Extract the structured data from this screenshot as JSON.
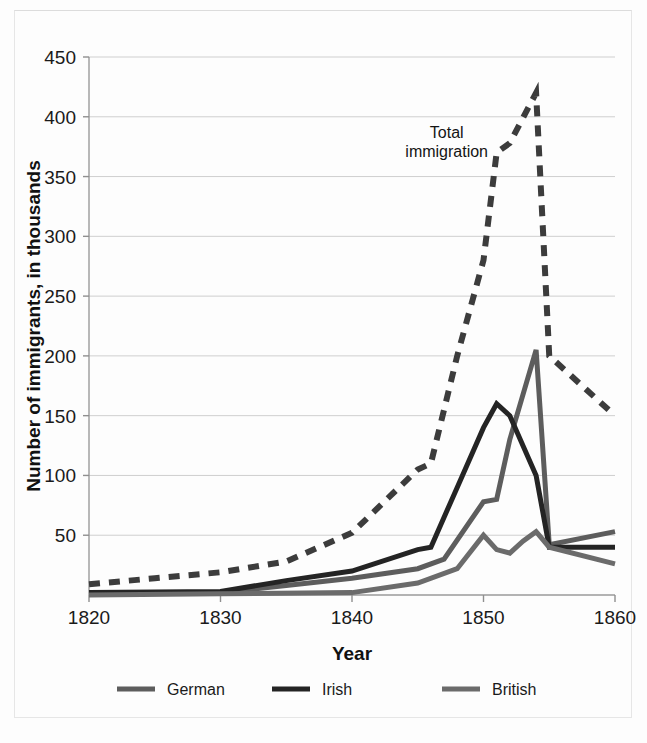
{
  "chart_data": {
    "type": "line",
    "title": "",
    "xlabel": "Year",
    "ylabel": "Number of immigrants, in thousands",
    "xlim": [
      1820,
      1860
    ],
    "ylim": [
      0,
      450
    ],
    "xticks": [
      "1820",
      "1830",
      "1840",
      "1850",
      "1860"
    ],
    "yticks": [
      "0",
      "50",
      "100",
      "150",
      "200",
      "250",
      "300",
      "350",
      "400",
      "450"
    ],
    "ytick_values": [
      50,
      100,
      150,
      200,
      250,
      300,
      350,
      400,
      450
    ],
    "grid": "horizontal",
    "legend_position": "bottom",
    "annotations": [
      {
        "name": "total-immigration-label",
        "lines": [
          "Total",
          "immigration"
        ],
        "x": 1847.2,
        "y": 382
      }
    ],
    "series": [
      {
        "name": "Total immigration",
        "key": "total",
        "style": "dashed",
        "color": "#3c3c3c",
        "width": 6,
        "in_legend": false,
        "x": [
          1820,
          1825,
          1830,
          1835,
          1840,
          1845,
          1846,
          1848,
          1850,
          1851,
          1852,
          1854,
          1855,
          1860
        ],
        "y": [
          9,
          14,
          19,
          28,
          52,
          105,
          110,
          200,
          280,
          370,
          378,
          420,
          200,
          150
        ]
      },
      {
        "name": "German",
        "key": "german",
        "style": "solid",
        "color": "#5d5d5d",
        "width": 5,
        "in_legend": true,
        "x": [
          1820,
          1830,
          1835,
          1840,
          1845,
          1847,
          1850,
          1851,
          1852,
          1854,
          1855,
          1860
        ],
        "y": [
          1,
          2,
          8,
          14,
          22,
          30,
          78,
          80,
          130,
          205,
          42,
          53
        ]
      },
      {
        "name": "Irish",
        "key": "irish",
        "style": "solid",
        "color": "#242424",
        "width": 5,
        "in_legend": true,
        "x": [
          1820,
          1830,
          1835,
          1840,
          1845,
          1846,
          1848,
          1850,
          1851,
          1852,
          1854,
          1855,
          1860
        ],
        "y": [
          2,
          3,
          12,
          20,
          38,
          40,
          90,
          140,
          160,
          150,
          100,
          40,
          40
        ]
      },
      {
        "name": "British",
        "key": "british",
        "style": "solid",
        "color": "#6b6b6b",
        "width": 5,
        "in_legend": true,
        "x": [
          1820,
          1830,
          1840,
          1845,
          1848,
          1850,
          1851,
          1852,
          1853,
          1854,
          1855,
          1860
        ],
        "y": [
          0,
          1,
          2,
          10,
          22,
          50,
          38,
          35,
          45,
          53,
          40,
          26
        ]
      }
    ],
    "legend": [
      {
        "label": "German",
        "color": "#5d5d5d"
      },
      {
        "label": "Irish",
        "color": "#242424"
      },
      {
        "label": "British",
        "color": "#6b6b6b"
      }
    ]
  },
  "axis": {
    "y_label": "Number of immigrants, in thousands",
    "x_label": "Year"
  }
}
